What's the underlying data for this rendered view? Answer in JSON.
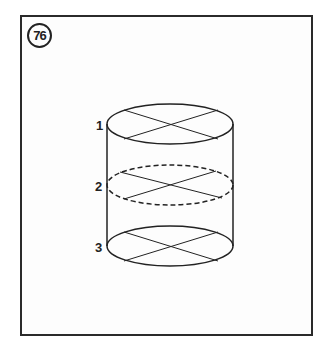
{
  "figure": {
    "number": "76",
    "labels": [
      {
        "text": "1",
        "level": "top"
      },
      {
        "text": "2",
        "level": "middle"
      },
      {
        "text": "3",
        "level": "bottom"
      }
    ],
    "colors": {
      "stroke": "#222222",
      "frame": "#2a2a2a",
      "background": "#ffffff"
    }
  }
}
